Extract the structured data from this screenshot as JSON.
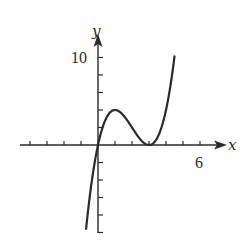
{
  "chart_data": {
    "type": "line",
    "title": "",
    "xlabel": "x",
    "ylabel": "y",
    "xlim": [
      -4.2,
      7.5
    ],
    "ylim": [
      -10,
      11
    ],
    "x_tick_step": 1,
    "y_tick_step": 2,
    "labeled_ticks": {
      "x": [
        {
          "value": 6,
          "label": "6"
        }
      ],
      "y": [
        {
          "value": 10,
          "label": "10"
        }
      ]
    },
    "grid": false,
    "legend": null,
    "series": [
      {
        "name": "f(x) = x(x-3)^2",
        "x": [
          -0.7,
          -0.5,
          -0.25,
          0,
          0.5,
          1,
          1.5,
          2,
          2.5,
          3,
          3.5,
          4,
          4.25,
          4.5
        ],
        "y": [
          -9.6,
          -6.1,
          -2.6,
          0,
          3.1,
          4.0,
          3.4,
          2.0,
          0.6,
          0,
          0.9,
          4.0,
          6.6,
          10.1
        ]
      }
    ],
    "annotations": {
      "local_max": [
        1,
        4
      ],
      "local_min": [
        3,
        0
      ]
    },
    "color": "#2a2a2a"
  },
  "axes": {
    "x_label": "x",
    "y_label": "y",
    "x_tick_label": "6",
    "y_tick_label": "10"
  }
}
